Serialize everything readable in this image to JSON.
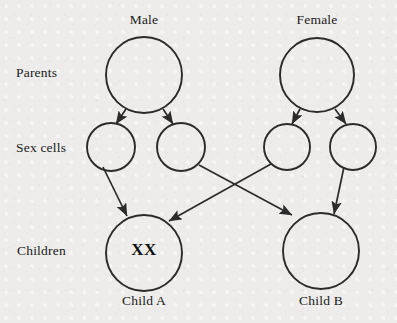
{
  "diagram": {
    "background_color": "#edecea",
    "stroke_color": "#2b2b2b",
    "row_labels": [
      {
        "id": "parents",
        "label": "Parents",
        "x": 16,
        "y": 65
      },
      {
        "id": "sex-cells",
        "label": "Sex cells",
        "x": 16,
        "y": 140
      },
      {
        "id": "children",
        "label": "Children",
        "x": 17,
        "y": 243
      }
    ],
    "nodes": [
      {
        "id": "male-parent",
        "row": "parents",
        "caption": "Male",
        "caption_position": "above",
        "cx": 144,
        "cy": 75,
        "r": 38,
        "content": ""
      },
      {
        "id": "female-parent",
        "row": "parents",
        "caption": "Female",
        "caption_position": "above",
        "cx": 317,
        "cy": 75,
        "r": 37,
        "content": ""
      },
      {
        "id": "sperm-1",
        "row": "sex-cells",
        "caption": "",
        "caption_position": "none",
        "cx": 111,
        "cy": 147,
        "r": 24,
        "content": ""
      },
      {
        "id": "sperm-2",
        "row": "sex-cells",
        "caption": "",
        "caption_position": "none",
        "cx": 181,
        "cy": 147,
        "r": 24,
        "content": ""
      },
      {
        "id": "egg-1",
        "row": "sex-cells",
        "caption": "",
        "caption_position": "none",
        "cx": 287,
        "cy": 147,
        "r": 23,
        "content": ""
      },
      {
        "id": "egg-2",
        "row": "sex-cells",
        "caption": "",
        "caption_position": "none",
        "cx": 353,
        "cy": 147,
        "r": 23,
        "content": ""
      },
      {
        "id": "child-a",
        "row": "children",
        "caption": "Child A",
        "caption_position": "below",
        "cx": 144,
        "cy": 253,
        "r": 38,
        "content": "XX"
      },
      {
        "id": "child-b",
        "row": "children",
        "caption": "Child B",
        "caption_position": "below",
        "cx": 321,
        "cy": 251,
        "r": 38,
        "content": ""
      }
    ],
    "arrows": [
      {
        "id": "male-to-sperm-1",
        "from": "male-parent",
        "to": "sperm-1",
        "x1": 126,
        "y1": 109,
        "x2": 116,
        "y2": 124
      },
      {
        "id": "male-to-sperm-2",
        "from": "male-parent",
        "to": "sperm-2",
        "x1": 163,
        "y1": 109,
        "x2": 173,
        "y2": 124
      },
      {
        "id": "female-to-egg-1",
        "from": "female-parent",
        "to": "egg-1",
        "x1": 300,
        "y1": 109,
        "x2": 292,
        "y2": 124
      },
      {
        "id": "female-to-egg-2",
        "from": "female-parent",
        "to": "egg-2",
        "x1": 335,
        "y1": 109,
        "x2": 346,
        "y2": 124
      },
      {
        "id": "sperm-1-to-child-a",
        "from": "sperm-1",
        "to": "child-a",
        "x1": 103,
        "y1": 167,
        "x2": 127,
        "y2": 217
      },
      {
        "id": "sperm-2-to-child-b",
        "from": "sperm-2",
        "to": "child-b",
        "x1": 199,
        "y1": 165,
        "x2": 293,
        "y2": 216
      },
      {
        "id": "egg-1-to-child-a",
        "from": "egg-1",
        "to": "child-a",
        "x1": 271,
        "y1": 164,
        "x2": 168,
        "y2": 221
      },
      {
        "id": "egg-2-to-child-b",
        "from": "egg-2",
        "to": "child-b",
        "x1": 344,
        "y1": 167,
        "x2": 335,
        "y2": 215
      }
    ],
    "captions": [
      {
        "id": "male-caption",
        "text": "Male",
        "cx": 144,
        "y": 12
      },
      {
        "id": "female-caption",
        "text": "Female",
        "cx": 317,
        "y": 12
      },
      {
        "id": "child-a-caption",
        "text": "Child A",
        "cx": 144,
        "y": 293
      },
      {
        "id": "child-b-caption",
        "text": "Child B",
        "cx": 321,
        "y": 293
      }
    ],
    "genotypes": [
      {
        "id": "child-a-genotype",
        "text": "XX",
        "cx": 144,
        "y": 240
      }
    ]
  }
}
